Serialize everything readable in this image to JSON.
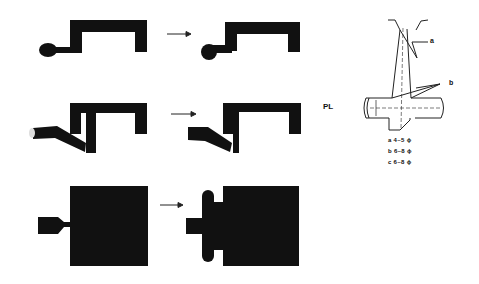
{
  "figure": {
    "colors": {
      "fill": "#111111",
      "line": "#222222",
      "background": "#ffffff"
    },
    "stages": [
      {
        "id": "row-1",
        "before": "gate-into-cavity",
        "after": "gate-into-cavity-filled",
        "arrow": "right-arrow"
      },
      {
        "id": "row-2",
        "before": "angled-gate-with-core",
        "after": "angled-gate-cavity",
        "arrow": "right-arrow"
      },
      {
        "id": "row-3",
        "before": "direct-gate-block",
        "after": "block-with-flash",
        "arrow": "right-arrow"
      }
    ],
    "section": {
      "parting_line_label": "PL",
      "callouts": {
        "a": "a",
        "b": "b"
      },
      "legend": [
        {
          "key": "a",
          "text": "a 4~5 ϕ"
        },
        {
          "key": "b",
          "text": "b 6~8 ϕ"
        },
        {
          "key": "c",
          "text": "c 6~8 ϕ"
        }
      ]
    }
  }
}
